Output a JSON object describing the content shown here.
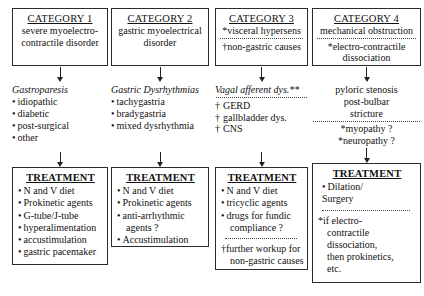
{
  "diagram": {
    "type": "flowchart",
    "columns": [
      {
        "id": "category-1",
        "category": {
          "title": "CATEGORY 1",
          "lines": [
            "severe myoelectro-",
            "contractile disorder"
          ],
          "separator": false
        },
        "middle": {
          "heading": "Gastroparesis",
          "separator": false,
          "items": [
            "idiopathic",
            "diabetic",
            "post-surgical",
            "other"
          ],
          "marker": "bullet",
          "align": "left"
        },
        "treatment": {
          "title": "TREATMENT",
          "items": [
            "N and V diet",
            "Prokinetic agents",
            "G-tube/J-tube",
            "hyperalimentation",
            "accustimulation",
            "gastric pacemaker"
          ],
          "marker": "bullet",
          "separator": false,
          "notes": []
        }
      },
      {
        "id": "category-2",
        "category": {
          "title": "CATEGORY 2",
          "lines": [
            "gastric myoelectrical",
            "disorder"
          ],
          "separator": false
        },
        "middle": {
          "heading": "Gastric Dysrhythmias",
          "separator": false,
          "items": [
            "tachygastria",
            "bradygastria",
            "mixed dysrhythmia"
          ],
          "marker": "bullet",
          "align": "left"
        },
        "treatment": {
          "title": "TREATMENT",
          "items": [
            "N and V diet",
            "Prokinetic agents",
            "anti-arrhythmic",
            "agents ?",
            "Accustimulation"
          ],
          "indented": [
            false,
            false,
            false,
            true,
            false
          ],
          "marker": "bullet",
          "markers": [
            true,
            true,
            true,
            false,
            true
          ],
          "separator": false,
          "notes": []
        }
      },
      {
        "id": "category-3",
        "category": {
          "title": "CATEGORY 3",
          "lines": [
            "*visceral hypersens",
            "†non-gastric causes"
          ],
          "separator": true,
          "separator_after_line": 1
        },
        "middle": {
          "heading": "Vagal afferent dys.**",
          "separator": true,
          "items": [
            "GERD",
            "gallbladder dys.",
            "CNS"
          ],
          "marker": "dagger",
          "align": "left"
        },
        "treatment": {
          "title": "TREATMENT",
          "items": [
            "N and V diet",
            "tricyclic agents",
            "drugs for fundic",
            "compliance ?"
          ],
          "markers": [
            true,
            true,
            true,
            false
          ],
          "indented": [
            false,
            false,
            false,
            true
          ],
          "separator": true,
          "notes": [
            "†further workup for",
            "non-gastric causes"
          ],
          "notes_indented": [
            false,
            true
          ]
        }
      },
      {
        "id": "category-4",
        "category": {
          "title": "CATEGORY 4",
          "lines": [
            "mechanical obstruction",
            "*electro-contractile",
            "dissociation"
          ],
          "separator": true,
          "separator_after_line": 1
        },
        "middle": {
          "heading": "",
          "separator": true,
          "lines_before": [
            "pyloric stenosis",
            "post-bulbar",
            "stricture"
          ],
          "lines_before_indent": [
            false,
            false,
            true
          ],
          "items": [
            "*myopathy ?",
            "*neuropathy ?"
          ],
          "marker": "none",
          "align": "left"
        },
        "treatment": {
          "title": "TREATMENT",
          "items": [
            "Dilation/",
            "Surgery"
          ],
          "markers": [
            true,
            false
          ],
          "indented": [
            false,
            true
          ],
          "separator": true,
          "notes": [
            "*if electro-",
            "contractile",
            "dissociation,",
            "then prokinetics,",
            "etc."
          ],
          "notes_indented": [
            false,
            true,
            true,
            true,
            true
          ]
        }
      }
    ]
  },
  "style": {
    "border_color": "#2b2b2b",
    "text_color": "#111111",
    "background": "#ffffff"
  }
}
